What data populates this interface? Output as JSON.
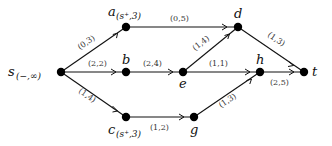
{
  "diagram": {
    "type": "flow-network",
    "nodes": [
      {
        "id": "s",
        "label": "s",
        "sub": "(−,∞)",
        "x": 61,
        "y": 72
      },
      {
        "id": "a",
        "label": "a",
        "sub": "(s⁺,3)",
        "x": 126,
        "y": 27
      },
      {
        "id": "b",
        "label": "b",
        "sub": "",
        "x": 126,
        "y": 72
      },
      {
        "id": "c",
        "label": "c",
        "sub": "(s⁺,3)",
        "x": 126,
        "y": 117
      },
      {
        "id": "d",
        "label": "d",
        "sub": "",
        "x": 238,
        "y": 27
      },
      {
        "id": "e",
        "label": "e",
        "sub": "",
        "x": 183,
        "y": 72
      },
      {
        "id": "g",
        "label": "g",
        "sub": "",
        "x": 194,
        "y": 117
      },
      {
        "id": "h",
        "label": "h",
        "sub": "",
        "x": 260,
        "y": 72
      },
      {
        "id": "t",
        "label": "t",
        "sub": "",
        "x": 304,
        "y": 72
      }
    ],
    "edges": [
      {
        "from": "s",
        "to": "a",
        "label": "(0,3)"
      },
      {
        "from": "s",
        "to": "b",
        "label": "(2,2)"
      },
      {
        "from": "s",
        "to": "c",
        "label": "(1,4)"
      },
      {
        "from": "a",
        "to": "d",
        "label": "(0,5)"
      },
      {
        "from": "b",
        "to": "e",
        "label": "(2,4)"
      },
      {
        "from": "e",
        "to": "d",
        "label": "(1,4)"
      },
      {
        "from": "e",
        "to": "h",
        "label": "(1,1)"
      },
      {
        "from": "d",
        "to": "t",
        "label": "(1,3)"
      },
      {
        "from": "h",
        "to": "t",
        "label": "(2,5)"
      },
      {
        "from": "c",
        "to": "g",
        "label": "(1,2)"
      },
      {
        "from": "g",
        "to": "h",
        "label": "(1,3)"
      }
    ]
  },
  "labels": {
    "s": "s",
    "s_sub": "(−,∞)",
    "a": "a",
    "a_sub": "(s⁺,3)",
    "b": "b",
    "c": "c",
    "c_sub": "(s⁺,3)",
    "d": "d",
    "e": "e",
    "g": "g",
    "h": "h",
    "t": "t",
    "e_sa": "(0,3)",
    "e_sb": "(2,2)",
    "e_sc": "(1,4)",
    "e_ad": "(0,5)",
    "e_be": "(2,4)",
    "e_ed": "(1,4)",
    "e_eh": "(1,1)",
    "e_dt": "(1,3)",
    "e_ht": "(2,5)",
    "e_cg": "(1,2)",
    "e_gh": "(1,3)"
  }
}
